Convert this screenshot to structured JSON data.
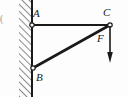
{
  "figure": {
    "background_color": "#fdfdfd",
    "stroke_color": "#1a1a1a",
    "edge_fragment": "("
  },
  "wall": {
    "name": "fixed vertical support wall",
    "hatch_direction": "up-right",
    "face_x": 32,
    "band_left": 19,
    "band_right": 32,
    "top": 0,
    "bottom": 97
  },
  "joints": [
    {
      "id": "A",
      "label": "A",
      "x": 32,
      "y": 25,
      "type": "pin",
      "on_wall": true
    },
    {
      "id": "B",
      "label": "B",
      "x": 33,
      "y": 68,
      "type": "pin",
      "on_wall": true
    },
    {
      "id": "C",
      "label": "C",
      "x": 110,
      "y": 25,
      "type": "pin",
      "on_wall": false
    }
  ],
  "members": [
    {
      "id": "AC",
      "label": "AC",
      "from": "A",
      "to": "C",
      "orientation": "horizontal"
    },
    {
      "id": "BC",
      "label": "BC",
      "from": "B",
      "to": "C",
      "orientation": "diagonal"
    }
  ],
  "load": {
    "label": "F",
    "applied_at": "C",
    "direction": "downward",
    "tail_x": 110,
    "tail_y": 26,
    "tip_x": 110,
    "tip_y": 62
  }
}
